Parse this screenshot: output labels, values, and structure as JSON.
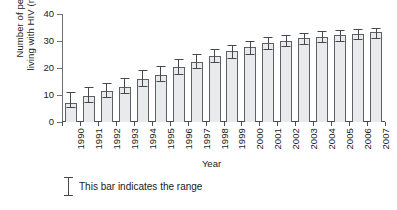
{
  "chart_data": {
    "type": "bar",
    "title": "",
    "subtitle": "",
    "xlabel": "Year",
    "ylabel": "Number of people living with HIV (millions)",
    "ylabel_line1": "Number of people",
    "ylabel_line2": "living with HIV (millions)",
    "categories": [
      "1990",
      "1991",
      "1992",
      "1993",
      "1994",
      "1995",
      "1996",
      "1997",
      "1998",
      "1999",
      "2000",
      "2001",
      "2002",
      "2003",
      "2004",
      "2005",
      "2006",
      "2007"
    ],
    "values": [
      7.0,
      9.5,
      11.5,
      13.0,
      15.8,
      17.5,
      20.2,
      22.3,
      24.6,
      26.2,
      27.7,
      29.2,
      30.1,
      31.0,
      31.6,
      32.1,
      32.7,
      33.2
    ],
    "error_low": [
      5.0,
      7.2,
      9.0,
      10.3,
      13.0,
      14.8,
      17.4,
      19.6,
      21.8,
      23.4,
      25.0,
      26.6,
      27.7,
      28.6,
      29.3,
      29.8,
      30.4,
      30.9
    ],
    "error_high": [
      11.2,
      13.1,
      14.6,
      16.2,
      19.2,
      20.6,
      23.2,
      25.2,
      27.2,
      28.6,
      30.0,
      31.4,
      32.2,
      33.0,
      33.6,
      34.0,
      34.5,
      34.9
    ],
    "yticks": [
      0,
      10,
      20,
      30,
      40
    ],
    "ylim": [
      0,
      40
    ],
    "grid": false,
    "legend_position": "below-plot",
    "legend": [
      "This bar indicates the range"
    ],
    "bar_color": "#e9eaec",
    "bar_edge_color": "#5d6165",
    "error_color": "#45494d",
    "axis_color": "#4a4e52"
  },
  "legend": {
    "range_note": "This bar indicates the range"
  }
}
